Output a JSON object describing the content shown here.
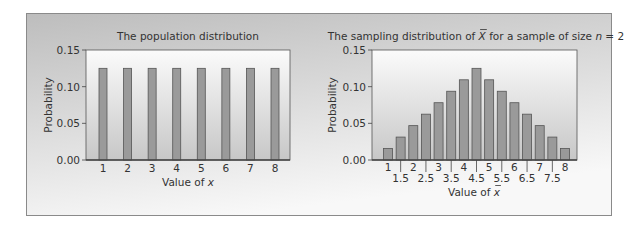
{
  "colors": {
    "bar_fill": "#9a9a9a",
    "bar_stroke": "#555555",
    "panel_bg_top": "#bdbdbd",
    "panel_bg_bottom": "#f8f8f8",
    "plot_bg_top": "#fbfbfb",
    "plot_bg_bottom": "#c7c7c7",
    "axis": "#444444",
    "text": "#333333"
  },
  "chart_data": [
    {
      "type": "bar",
      "title": "The population distribution",
      "xlabel_prefix": "Value of ",
      "xlabel_var": "x",
      "ylabel": "Probability",
      "ylim": [
        0,
        0.15
      ],
      "yticks": [
        0.0,
        0.05,
        0.1,
        0.15
      ],
      "ytick_labels": [
        "0.00",
        "0.05",
        "0.10",
        "0.15"
      ],
      "categories": [
        "1",
        "2",
        "3",
        "4",
        "5",
        "6",
        "7",
        "8"
      ],
      "x": [
        1,
        2,
        3,
        4,
        5,
        6,
        7,
        8
      ],
      "values": [
        0.125,
        0.125,
        0.125,
        0.125,
        0.125,
        0.125,
        0.125,
        0.125
      ],
      "grid": false
    },
    {
      "type": "bar",
      "title_prefix": "The sampling distribution of ",
      "title_var": "X",
      "title_middle": " for a sample of size ",
      "title_n": "n",
      "title_suffix": " = 2",
      "xlabel_prefix": "Value of ",
      "xlabel_var": "x",
      "ylabel": "Probability",
      "ylim": [
        0,
        0.15
      ],
      "yticks": [
        0.0,
        0.05,
        0.1,
        0.15
      ],
      "ytick_labels": [
        "0.00",
        "0.05",
        "0.10",
        "0.15"
      ],
      "x": [
        1,
        1.5,
        2,
        2.5,
        3,
        3.5,
        4,
        4.5,
        5,
        5.5,
        6,
        6.5,
        7,
        7.5,
        8
      ],
      "categories_upper": [
        "1",
        "2",
        "3",
        "4",
        "5",
        "6",
        "7",
        "8"
      ],
      "categories_lower": [
        "1.5",
        "2.5",
        "3.5",
        "4.5",
        "5.5",
        "6.5",
        "7.5"
      ],
      "values": [
        0.015625,
        0.03125,
        0.046875,
        0.0625,
        0.078125,
        0.09375,
        0.109375,
        0.125,
        0.109375,
        0.09375,
        0.078125,
        0.0625,
        0.046875,
        0.03125,
        0.015625
      ],
      "grid": false
    }
  ]
}
